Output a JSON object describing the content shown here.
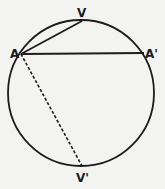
{
  "diagram": {
    "type": "geometry-circle-chords",
    "colors": {
      "background": "#f3f3f1",
      "stroke": "#1c1c1c"
    },
    "circle": {
      "cx": 81,
      "cy": 93,
      "r": 73
    },
    "points": [
      {
        "id": "A",
        "label": "A",
        "x": 21,
        "y": 54
      },
      {
        "id": "V",
        "label": "V",
        "x": 82,
        "y": 21
      },
      {
        "id": "A_prime",
        "label": "A'",
        "x": 144,
        "y": 53
      },
      {
        "id": "V_prime",
        "label": "V'",
        "x": 82,
        "y": 166
      }
    ],
    "segments": [
      {
        "from": "A",
        "to": "V",
        "style": "solid"
      },
      {
        "from": "A",
        "to": "A_prime",
        "style": "solid"
      },
      {
        "from": "A",
        "to": "V_prime",
        "style": "dashed"
      }
    ],
    "labels": {
      "A": "A",
      "V": "V",
      "A_prime": "A'",
      "V_prime": "V'"
    }
  }
}
